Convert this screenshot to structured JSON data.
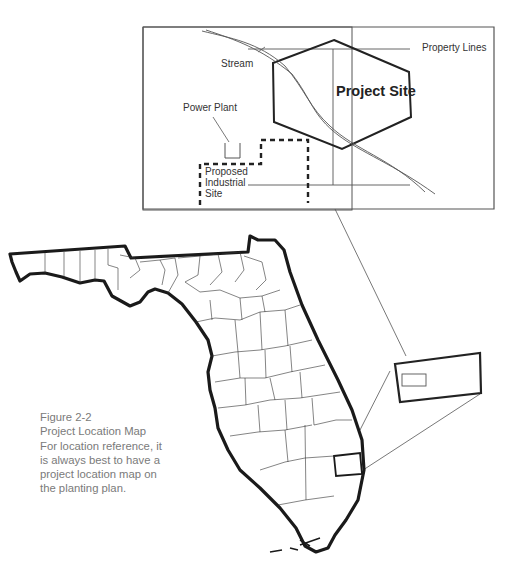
{
  "inset": {
    "title": "Project Site",
    "labels": {
      "property_lines": "Property Lines",
      "stream": "Stream",
      "power_plant": "Power Plant",
      "proposed_line1": "Proposed",
      "proposed_line2": "Industrial",
      "proposed_line3": "Site"
    }
  },
  "caption": {
    "figure": "Figure 2-2",
    "title": "Project Location Map",
    "lines": [
      "For location reference, it",
      "is always best to have a",
      "project location map on",
      "the planting plan."
    ]
  },
  "colors": {
    "outline": "#1a1a1a",
    "thin_line": "#444444",
    "caption_text": "#7a7a7a"
  }
}
